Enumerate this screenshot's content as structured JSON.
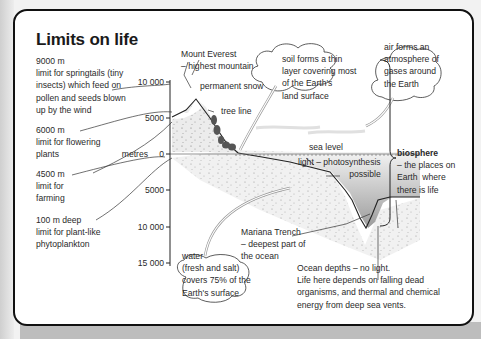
{
  "title": "Limits on life",
  "left_notes": [
    {
      "line1": "9000 m",
      "lines": [
        "limit for springtails (tiny",
        "insects) which feed on",
        "pollen and seeds blown",
        "up by the wind"
      ]
    },
    {
      "line1": "6000 m",
      "lines": [
        "limit for flowering",
        "plants"
      ]
    },
    {
      "line1": "4500 m",
      "lines": [
        "limit for",
        "farming"
      ]
    },
    {
      "line1": "100 m deep",
      "lines": [
        "limit for plant-like",
        "phytoplankton"
      ]
    }
  ],
  "axis": {
    "unit": "metres",
    "ticks": [
      "10 000",
      "5000",
      "0",
      "5000",
      "10 000",
      "15 000"
    ]
  },
  "labels": {
    "everest": [
      "Mount Everest",
      "– highest mountain"
    ],
    "snow": "permanent snow",
    "tree_line": "tree line",
    "sea_level": "sea level",
    "light": [
      "light – photosynthesis",
      "possible"
    ],
    "mariana": [
      "Mariana Trench",
      "– deepest part of",
      "the ocean"
    ],
    "ocean_depths": [
      "Ocean depths – no light.",
      "Life here depends on falling dead",
      "organisms, and thermal and chemical",
      "energy from deep sea vents."
    ]
  },
  "bubbles": {
    "soil": [
      "soil forms a thin",
      "layer covering most",
      "of the Earth's",
      "land surface"
    ],
    "air": [
      "air forms an",
      "atmosphere of",
      "gases around",
      "the Earth"
    ],
    "water": [
      "water",
      "(fresh and salt)",
      "covers 75% of the",
      "Earth's surface"
    ]
  },
  "biosphere": {
    "term": "biosphere",
    "definition": [
      "– the places on",
      "Earth  where",
      "there is life"
    ]
  },
  "colors": {
    "border": "#111111",
    "land_stipple": "#e6e6e6",
    "water_gradient_top": "#f0f0f0",
    "water_gradient_bottom": "#a8a8a8",
    "text": "#2a2a2a"
  }
}
